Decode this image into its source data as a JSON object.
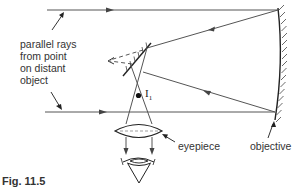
{
  "figure": {
    "caption": "Fig. 11.5"
  },
  "labels": {
    "incoming_rays_lines": [
      "parallel rays",
      "from point",
      "on distant",
      "object"
    ],
    "image_point": "I",
    "image_point_subscript": "1",
    "eyepiece": "eyepiece",
    "objective": "objective"
  },
  "colors": {
    "line": "#444444",
    "text": "#333333",
    "background": "#ffffff"
  },
  "components": [
    {
      "name": "objective",
      "type": "concave-mirror"
    },
    {
      "name": "plane-mirror",
      "type": "flat-mirror"
    },
    {
      "name": "image-point",
      "type": "focal-point",
      "label": "I1"
    },
    {
      "name": "eyepiece",
      "type": "convex-lens"
    },
    {
      "name": "eye",
      "type": "observer"
    }
  ]
}
